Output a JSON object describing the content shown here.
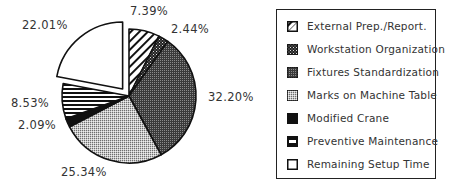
{
  "chart_data": {
    "type": "pie",
    "title": "",
    "exploded": "Remaining Setup Time",
    "legend_position": "right",
    "categories": [
      "External Prep./Report.",
      "Workstation Organization",
      "Fixtures Standardization",
      "Marks on Machine Table",
      "Modified Crane",
      "Preventive Maintenance",
      "Remaining Setup Time"
    ],
    "values": [
      7.39,
      2.44,
      32.2,
      25.34,
      2.09,
      8.53,
      22.01
    ],
    "labels": [
      "7.39%",
      "2.44%",
      "32.20%",
      "25.34%",
      "2.09%",
      "8.53%",
      "22.01%"
    ],
    "patterns": [
      "diagonal-stripes",
      "dense-dots",
      "dark-checker",
      "light-checker",
      "solid-black",
      "horizontal-stripes",
      "white"
    ]
  },
  "legend": {
    "items": [
      {
        "label": "External Prep./Report.",
        "pattern": "diagonal-stripes"
      },
      {
        "label": "Workstation Organization",
        "pattern": "dense-dots"
      },
      {
        "label": "Fixtures Standardization",
        "pattern": "dark-checker"
      },
      {
        "label": "Marks on Machine Table",
        "pattern": "light-checker"
      },
      {
        "label": "Modified Crane",
        "pattern": "solid-black"
      },
      {
        "label": "Preventive Maintenance",
        "pattern": "horizontal-stripes"
      },
      {
        "label": "Remaining Setup Time",
        "pattern": "white"
      }
    ]
  },
  "slice_labels": {
    "external": "7.39%",
    "workstation": "2.44%",
    "fixtures": "32.20%",
    "marks": "25.34%",
    "crane": "2.09%",
    "preventive": "8.53%",
    "remaining": "22.01%"
  }
}
